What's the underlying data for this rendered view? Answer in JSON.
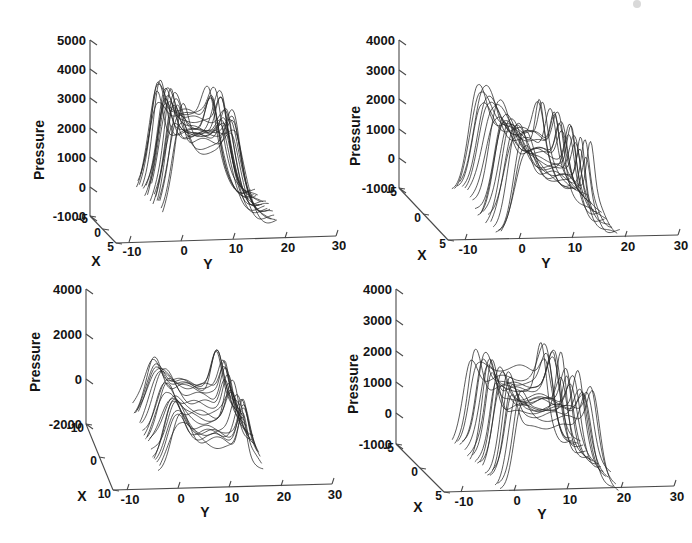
{
  "figure": {
    "layout": "2x2 grid of 3D waterfall (ribbon) plots",
    "background_color": "#ffffff",
    "trace_color": "#252525",
    "axis_color": "#4a4a4a"
  },
  "chart_data": [
    {
      "id": "top-left",
      "type": "line",
      "title": "",
      "xlabel": "Y",
      "ylabel": "X",
      "zlabel": "Pressure",
      "x_axis": {
        "label": "X",
        "ticks": [
          "-5",
          "0",
          "5"
        ],
        "values": [
          -5,
          0,
          5
        ],
        "range": [
          -5,
          5
        ]
      },
      "y_axis": {
        "label": "Y",
        "ticks": [
          "-10",
          "0",
          "10",
          "20",
          "30"
        ],
        "values": [
          -10,
          0,
          10,
          20,
          30
        ],
        "range": [
          -10,
          30
        ]
      },
      "z_axis": {
        "label": "Pressure",
        "ticks": [
          "5000",
          "4000",
          "3000",
          "2000",
          "1000",
          "0",
          "-1000"
        ],
        "values": [
          5000,
          4000,
          3000,
          2000,
          1000,
          0,
          -1000
        ],
        "range": [
          -1000,
          5000
        ]
      },
      "grid": false,
      "legend": "none",
      "n_traces": 20,
      "shape": "double-peaked (M) pressure waveform bundle, first peak ~3000-3700, central trough ~1500-2500, second peak ~2800-3200, tails down to ~-400",
      "peak1_value": 3300,
      "trough_value": 2100,
      "peak2_value": 3000,
      "tail_value": -400
    },
    {
      "id": "top-right",
      "type": "line",
      "title": "",
      "xlabel": "Y",
      "ylabel": "X",
      "zlabel": "Pressure",
      "x_axis": {
        "label": "X",
        "ticks": [
          "-5",
          "0",
          "5"
        ],
        "values": [
          -5,
          0,
          5
        ],
        "range": [
          -5,
          5
        ]
      },
      "y_axis": {
        "label": "Y",
        "ticks": [
          "-10",
          "0",
          "10",
          "20",
          "30"
        ],
        "values": [
          -10,
          0,
          10,
          20,
          30
        ],
        "range": [
          -10,
          30
        ]
      },
      "z_axis": {
        "label": "Pressure",
        "ticks": [
          "4000",
          "3000",
          "2000",
          "1000",
          "0",
          "-1000"
        ],
        "values": [
          4000,
          3000,
          2000,
          1000,
          0,
          -1000
        ],
        "range": [
          -1000,
          4000
        ]
      },
      "grid": false,
      "legend": "none",
      "n_traces": 20,
      "shape": "rounded first peak ~1800-2600 then sloping decay to trough ~300-700, sharp narrow second peak ~1800-2000, tails down to ~-1000",
      "peak1_value": 2200,
      "trough_value": 500,
      "peak2_value": 1900,
      "tail_value": -1000
    },
    {
      "id": "bottom-left",
      "type": "line",
      "title": "",
      "xlabel": "Y",
      "ylabel": "X",
      "zlabel": "Pressure",
      "x_axis": {
        "label": "X",
        "ticks": [
          "-10",
          "0",
          "10"
        ],
        "values": [
          -10,
          0,
          10
        ],
        "range": [
          -10,
          10
        ]
      },
      "y_axis": {
        "label": "Y",
        "ticks": [
          "-10",
          "0",
          "10",
          "20",
          "30"
        ],
        "values": [
          -10,
          0,
          10,
          20,
          30
        ],
        "range": [
          -10,
          30
        ]
      },
      "z_axis": {
        "label": "Pressure",
        "ticks": [
          "4000",
          "2000",
          "0",
          "-2000"
        ],
        "values": [
          4000,
          2000,
          0,
          -2000
        ],
        "range": [
          -2000,
          4000
        ]
      },
      "grid": false,
      "legend": "none",
      "n_traces": 20,
      "shape": "flattened low-amplitude bundle, first peak ~600-1600, broad shallow trough ~-400, second peak ~900-1500, tails to ~-1400",
      "peak1_value": 900,
      "trough_value": -400,
      "peak2_value": 1100,
      "tail_value": -1400
    },
    {
      "id": "bottom-right",
      "type": "line",
      "title": "",
      "xlabel": "Y",
      "ylabel": "X",
      "zlabel": "Pressure",
      "x_axis": {
        "label": "X",
        "ticks": [
          "-5",
          "0",
          "5"
        ],
        "values": [
          -5,
          0,
          5
        ],
        "range": [
          -5,
          5
        ]
      },
      "y_axis": {
        "label": "Y",
        "ticks": [
          "-10",
          "0",
          "10",
          "20",
          "30"
        ],
        "values": [
          -10,
          0,
          10,
          20,
          30
        ],
        "range": [
          -10,
          30
        ]
      },
      "z_axis": {
        "label": "Pressure",
        "ticks": [
          "4000",
          "3000",
          "2000",
          "1000",
          "0",
          "-1000"
        ],
        "values": [
          4000,
          3000,
          2000,
          1000,
          0,
          -1000
        ],
        "range": [
          -1000,
          4000
        ]
      },
      "grid": false,
      "legend": "none",
      "n_traces": 20,
      "shape": "broad plateau bundle with first peak ~1400-2400, wide sagging trough ~500-1400, second peak ~1600-2300, steep tails to ~-1000",
      "peak1_value": 1900,
      "trough_value": 900,
      "peak2_value": 2000,
      "tail_value": -1000
    }
  ],
  "panels": {
    "top_left": {
      "z_label": "Pressure",
      "z_ticks": [
        "5000",
        "4000",
        "3000",
        "2000",
        "1000",
        "0",
        "-1000"
      ],
      "x_label": "X",
      "x_ticks": [
        "-5",
        "0",
        "5"
      ],
      "y_label": "Y",
      "y_ticks": [
        "-10",
        "0",
        "10",
        "20",
        "30"
      ]
    },
    "top_right": {
      "z_label": "Pressure",
      "z_ticks": [
        "4000",
        "3000",
        "2000",
        "1000",
        "0",
        "-1000"
      ],
      "x_label": "X",
      "x_ticks": [
        "-5",
        "0",
        "5"
      ],
      "y_label": "Y",
      "y_ticks": [
        "-10",
        "0",
        "10",
        "20",
        "30"
      ]
    },
    "bottom_left": {
      "z_label": "Pressure",
      "z_ticks": [
        "4000",
        "2000",
        "0",
        "-2000"
      ],
      "x_label": "X",
      "x_ticks": [
        "-10",
        "0",
        "10"
      ],
      "y_label": "Y",
      "y_ticks": [
        "-10",
        "0",
        "10",
        "20",
        "30"
      ]
    },
    "bottom_right": {
      "z_label": "Pressure",
      "z_ticks": [
        "4000",
        "3000",
        "2000",
        "1000",
        "0",
        "-1000"
      ],
      "x_label": "X",
      "x_ticks": [
        "-5",
        "0",
        "5"
      ],
      "y_label": "Y",
      "y_ticks": [
        "-10",
        "0",
        "10",
        "20",
        "30"
      ]
    }
  }
}
